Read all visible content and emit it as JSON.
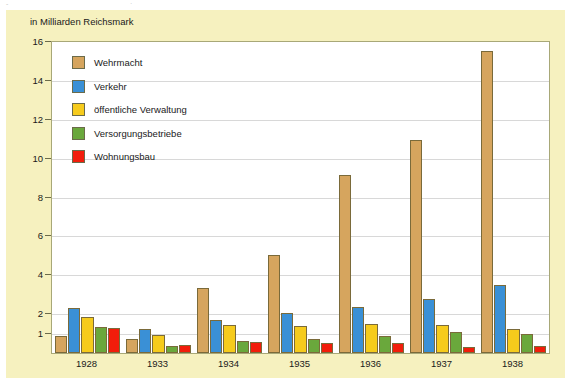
{
  "top_strip": {
    "ghost_left": "-",
    "ghost_mid": "·"
  },
  "chart_data": {
    "type": "bar",
    "title": "",
    "subtitle": "",
    "unit_label": "in Milliarden Reichsmark",
    "xlabel": "",
    "ylabel": "in Milliarden Reichsmark",
    "categories": [
      "1928",
      "1933",
      "1934",
      "1935",
      "1936",
      "1937",
      "1938"
    ],
    "ylim": [
      0,
      16
    ],
    "yticks": [
      16,
      14,
      12,
      10,
      8,
      6,
      4,
      2,
      1
    ],
    "ytick_labels": [
      "16",
      "14",
      "12",
      "10",
      "8",
      "6",
      "4",
      "2",
      "1"
    ],
    "grid": true,
    "legend_position": "inside-top-left",
    "series": [
      {
        "name": "Wehrmacht",
        "color": "#d6a55e",
        "values": [
          0.9,
          0.7,
          3.35,
          5.05,
          9.15,
          10.95,
          15.55
        ]
      },
      {
        "name": "Verkehr",
        "color": "#3a90d6",
        "values": [
          2.3,
          1.25,
          1.7,
          2.05,
          2.35,
          2.8,
          3.5
        ]
      },
      {
        "name": "öffentliche Verwaltung",
        "color": "#f6cb1c",
        "values": [
          1.85,
          0.95,
          1.45,
          1.4,
          1.5,
          1.45,
          1.25
        ]
      },
      {
        "name": "Versorgungsbetriebe",
        "color": "#6aa83c",
        "values": [
          1.35,
          0.35,
          0.6,
          0.7,
          0.85,
          1.1,
          1.0
        ]
      },
      {
        "name": "Wohnungsbau",
        "color": "#f21d0b",
        "values": [
          1.3,
          0.4,
          0.55,
          0.5,
          0.5,
          0.3,
          0.35
        ]
      }
    ]
  },
  "colors": {
    "card_background": "#f6f1bf",
    "plot_background": "#ffffff",
    "plot_border": "#a8a878",
    "gridline": "#d8d8d8",
    "text": "#1a1a1a"
  }
}
